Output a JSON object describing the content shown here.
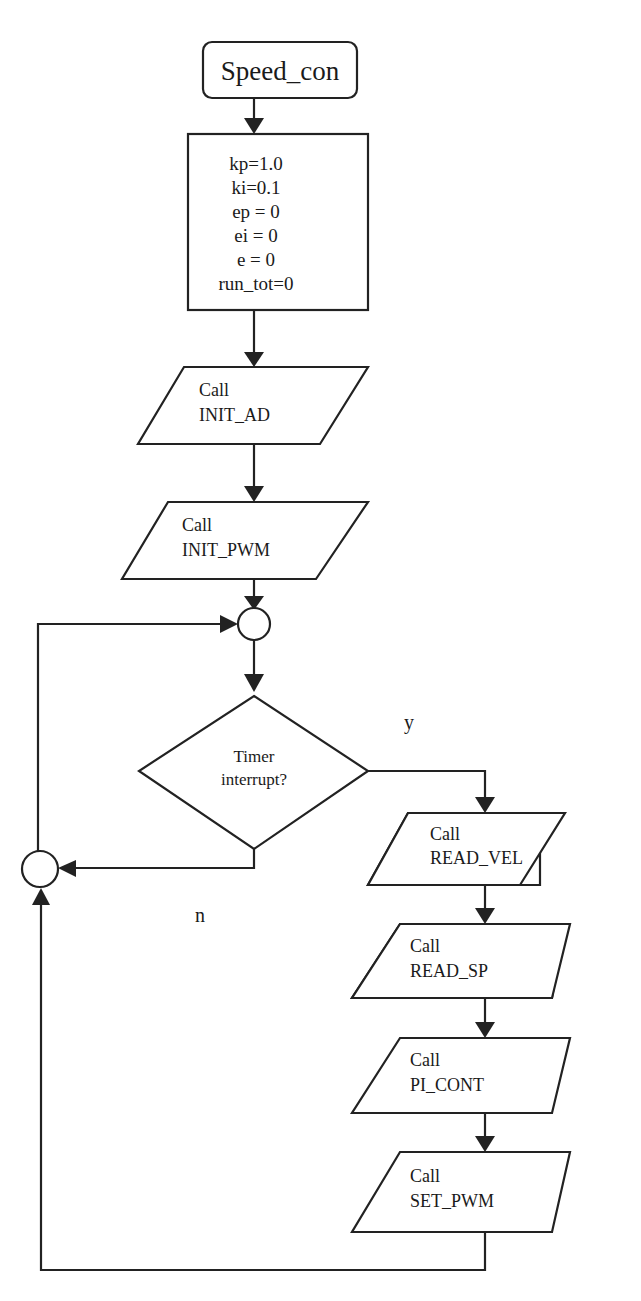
{
  "diagram": {
    "type": "flowchart",
    "start": {
      "label": "Speed_con"
    },
    "init_block": {
      "lines": [
        "kp=1.0",
        "ki=0.1",
        "ep = 0",
        "ei = 0",
        "e = 0",
        "run_tot=0"
      ]
    },
    "init_calls": [
      {
        "line1": "Call",
        "line2": "INIT_AD"
      },
      {
        "line1": "Call",
        "line2": "INIT_PWM"
      }
    ],
    "decision": {
      "line1": "Timer",
      "line2": "interrupt?",
      "yes_label": "y",
      "no_label": "n"
    },
    "loop_calls": [
      {
        "line1": "Call",
        "line2": "READ_VEL"
      },
      {
        "line1": "Call",
        "line2": "READ_SP"
      },
      {
        "line1": "Call",
        "line2": "PI_CONT"
      },
      {
        "line1": "Call",
        "line2": "SET_PWM"
      }
    ],
    "colors": {
      "stroke": "#222222",
      "background": "#ffffff",
      "text": "#1a1a1a"
    }
  }
}
